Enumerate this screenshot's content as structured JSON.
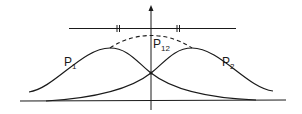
{
  "diagram": {
    "labels": {
      "p1": {
        "base": "P",
        "sub": "1"
      },
      "p2": {
        "base": "P",
        "sub": "2"
      },
      "p12": {
        "base": "P",
        "sub": "12"
      }
    },
    "elements": [
      "vertical axis with arrow",
      "screen baseline",
      "barrier line with two slits",
      "curve P1 peaked left",
      "curve P2 peaked right",
      "dashed curve P12 summed distribution"
    ],
    "colors": {
      "stroke": "#1a1a1a",
      "background": "#ffffff"
    }
  }
}
